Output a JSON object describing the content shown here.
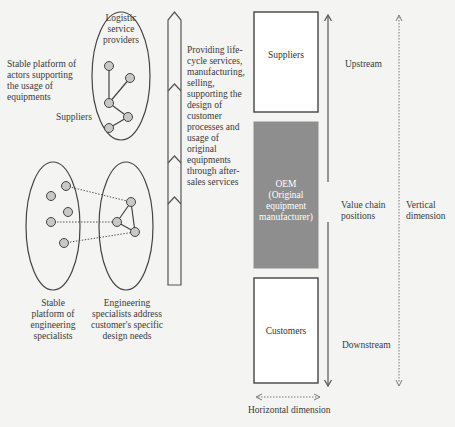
{
  "left_panel": {
    "top_cluster": {
      "title": "Logistic service providers",
      "title_lines": [
        "Logistic",
        "service",
        "providers"
      ],
      "side_label_lines": [
        "Stable platform of",
        "actors supporting",
        "the usage of",
        "equipments"
      ],
      "suppliers_label": "Suppliers"
    },
    "bottom_left_cluster": {
      "label_lines": [
        "Stable",
        "platform of",
        "engineering",
        "specialists"
      ]
    },
    "bottom_right_cluster": {
      "label_lines": [
        "Engineering",
        "specialists address",
        "customer's specific",
        "design needs"
      ]
    }
  },
  "process_arrow": {
    "description_lines": [
      "Providing life-",
      "cycle services,",
      "manufacturing,",
      "selling,",
      "supporting the",
      "design of",
      "customer",
      "processes and",
      "usage of",
      "original",
      "equipments",
      "through after-",
      "sales services"
    ]
  },
  "value_chain": {
    "boxes": [
      {
        "label_lines": [
          "Suppliers"
        ],
        "fill": "#ffffff"
      },
      {
        "label_lines": [
          "OEM",
          "(Original",
          "equipment",
          "manufacturer)"
        ],
        "fill": "#8e8e8e"
      },
      {
        "label_lines": [
          "Customers"
        ],
        "fill": "#ffffff"
      }
    ],
    "upstream": "Upstream",
    "positions_lines": [
      "Value chain",
      "positions"
    ],
    "downstream": "Downstream",
    "vertical_dimension_lines": [
      "Vertical",
      "dimension"
    ],
    "horizontal_dimension": "Horizontal dimension"
  }
}
